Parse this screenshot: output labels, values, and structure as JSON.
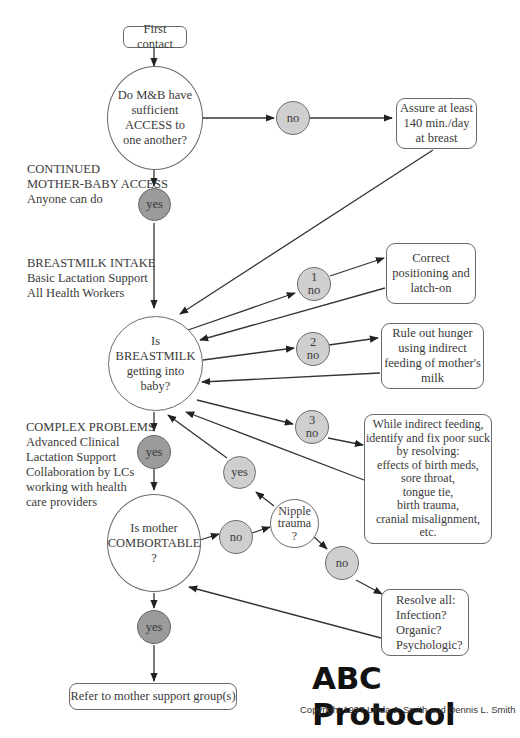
{
  "diagram": {
    "title": "ABC Protocol",
    "copyright": "Copyright 1997 Linda J. Smith and Dennis L. Smith",
    "start": "First contact",
    "questions": {
      "access": [
        "Do M&B have",
        "sufficient",
        "ACCESS to",
        "one another?"
      ],
      "breastmilk": [
        "Is",
        "BREASTMILK",
        "getting into",
        "baby?"
      ],
      "comfortable": [
        "Is mother",
        "COMBORTABLE",
        "?"
      ],
      "nipple": [
        "Nipple",
        "trauma",
        "?"
      ]
    },
    "decisions": {
      "access_no": "no",
      "access_yes": "yes",
      "bm_no1": [
        "1",
        "no"
      ],
      "bm_no2": [
        "2",
        "no"
      ],
      "bm_no3": [
        "3",
        "no"
      ],
      "bm_yes": "yes",
      "comfort_no": "no",
      "comfort_yes": "yes",
      "nipple_yes": "yes",
      "nipple_no": "no"
    },
    "actions": {
      "assure": [
        "Assure at least",
        "140 min./day",
        "at breast"
      ],
      "correct": [
        "Correct",
        "positioning and",
        "latch-on"
      ],
      "rule_out": [
        "Rule out hunger",
        "using indirect",
        "feeding of mother's",
        "milk"
      ],
      "indirect": [
        "While indirect feeding,",
        "identify and fix poor suck",
        "by resolving:",
        "effects of birth meds,",
        "sore throat,",
        "tongue tie,",
        "birth trauma,",
        "cranial misalignment,",
        "etc."
      ],
      "resolve": [
        "Resolve all:",
        "Infection?",
        "Organic?",
        "Psychologic?"
      ],
      "refer": "Refer to mother support group(s)"
    },
    "notes": {
      "access": [
        "CONTINUED",
        "MOTHER-BABY ACCESS",
        "Anyone can do"
      ],
      "intake": [
        "BREASTMILK INTAKE",
        "Basic Lactation Support",
        "All Health Workers"
      ],
      "complex": [
        "COMPLEX PROBLEMS",
        "Advanced Clinical",
        "Lactation Support",
        "Collaboration by LCs",
        "working with health",
        "care providers"
      ]
    }
  }
}
